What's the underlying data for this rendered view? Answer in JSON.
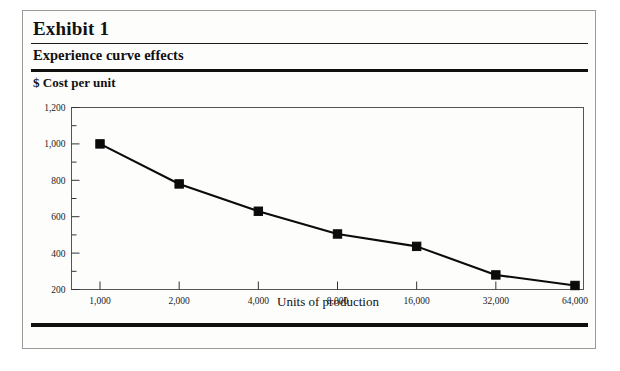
{
  "exhibit": {
    "title": "Exhibit 1",
    "subtitle": "Experience curve effects",
    "y_caption": "$ Cost per unit"
  },
  "chart_data": {
    "type": "line",
    "title": "Experience curve effects",
    "xlabel": "Units of production",
    "ylabel": "$ Cost per unit",
    "x_scale": "log2",
    "categories": [
      "1,000",
      "2,000",
      "4,000",
      "8,000",
      "16,000",
      "32,000",
      "64,000"
    ],
    "x": [
      1000,
      2000,
      4000,
      8000,
      16000,
      32000,
      64000
    ],
    "values": [
      1000,
      780,
      630,
      505,
      437,
      280,
      222
    ],
    "ylim": [
      200,
      1200
    ],
    "y_ticks": [
      "200",
      "400",
      "600",
      "800",
      "1,000",
      "1,200"
    ],
    "y_tick_values": [
      200,
      400,
      600,
      800,
      1000,
      1200
    ],
    "y_minor_ticks": true,
    "grid": false,
    "legend": "none",
    "marker": "square",
    "series": [
      {
        "name": "Cost per unit",
        "values": [
          1000,
          780,
          630,
          505,
          437,
          280,
          222
        ]
      }
    ]
  },
  "colors": {
    "line": "#0b0b0b",
    "frame": "#555555",
    "rule": "#101010",
    "page_border": "#9a9a9a"
  }
}
